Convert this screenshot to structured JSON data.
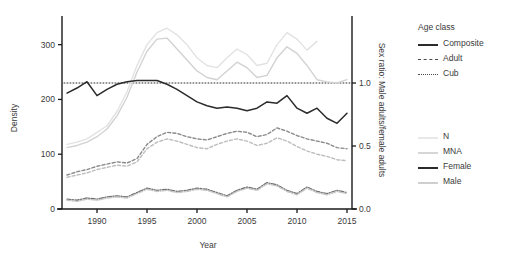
{
  "chart_data": {
    "type": "line",
    "title": "",
    "xlabel": "Year",
    "ylabel": "Density",
    "y2label": "Sex ratio: Male adults/female adults",
    "xlim": [
      1986.5,
      2015.5
    ],
    "ylim": [
      0,
      345
    ],
    "y2lim": [
      0,
      1.5
    ],
    "grid": false,
    "xticks": [
      "1990",
      "1995",
      "2000",
      "2005",
      "2010",
      "2015"
    ],
    "xtick_values": [
      1990,
      1995,
      2000,
      2005,
      2010,
      2015
    ],
    "yticks": [
      "0",
      "100",
      "200",
      "300"
    ],
    "ytick_values": [
      0,
      100,
      200,
      300
    ],
    "y2ticks": [
      "0.0",
      "0.5",
      "1.0"
    ],
    "y2tick_values": [
      0.0,
      0.5,
      1.0
    ],
    "reference_line": {
      "axis": "y2",
      "value": 1.0,
      "style": "dotted",
      "color": "#2b2b2b"
    },
    "x": [
      1987,
      1988,
      1989,
      1990,
      1991,
      1992,
      1993,
      1994,
      1995,
      1996,
      1997,
      1998,
      1999,
      2000,
      2001,
      2002,
      2003,
      2004,
      2005,
      2006,
      2007,
      2008,
      2009,
      2010,
      2011,
      2012,
      2013,
      2014,
      2015
    ],
    "series": [
      {
        "name": "N",
        "age_class": "Composite",
        "linestyle": "solid",
        "color": "#e2e2e2",
        "axis": "left",
        "values": [
          118,
          122,
          128,
          140,
          152,
          178,
          214,
          262,
          300,
          322,
          330,
          318,
          300,
          276,
          262,
          258,
          276,
          292,
          282,
          262,
          266,
          300,
          322,
          310,
          290,
          306,
          null,
          null,
          null
        ]
      },
      {
        "name": "MNA",
        "age_class": "Composite",
        "linestyle": "solid",
        "color": "#d2d2d2",
        "axis": "left",
        "values": [
          112,
          116,
          122,
          132,
          146,
          170,
          204,
          250,
          288,
          310,
          312,
          292,
          272,
          252,
          240,
          236,
          252,
          268,
          258,
          240,
          244,
          276,
          296,
          284,
          262,
          236,
          232,
          230,
          236
        ]
      },
      {
        "name": "N",
        "age_class": "Adult",
        "linestyle": "dashed",
        "color": "#8a8a8a",
        "axis": "left",
        "values": [
          62,
          68,
          72,
          78,
          82,
          86,
          84,
          92,
          118,
          132,
          140,
          138,
          132,
          128,
          126,
          132,
          138,
          142,
          140,
          132,
          136,
          148,
          142,
          134,
          128,
          124,
          120,
          112,
          110
        ]
      },
      {
        "name": "MNA",
        "age_class": "Adult",
        "linestyle": "dashed",
        "color": "#bdbdbd",
        "axis": "left",
        "values": [
          58,
          62,
          66,
          72,
          76,
          80,
          78,
          86,
          110,
          122,
          128,
          124,
          118,
          112,
          110,
          118,
          124,
          128,
          124,
          116,
          120,
          130,
          124,
          114,
          106,
          100,
          96,
          90,
          88
        ]
      },
      {
        "name": "N",
        "age_class": "Cub",
        "linestyle": "dashdot",
        "color": "#6e6e6e",
        "axis": "left",
        "values": [
          18,
          16,
          20,
          18,
          22,
          24,
          22,
          30,
          38,
          34,
          36,
          32,
          34,
          38,
          36,
          30,
          24,
          34,
          40,
          36,
          48,
          44,
          34,
          28,
          40,
          32,
          28,
          34,
          30
        ]
      },
      {
        "name": "MNA",
        "age_class": "Cub",
        "linestyle": "dashdot",
        "color": "#c6c6c6",
        "axis": "left",
        "values": [
          16,
          14,
          18,
          16,
          20,
          22,
          20,
          28,
          36,
          32,
          34,
          30,
          32,
          36,
          34,
          28,
          22,
          32,
          38,
          34,
          46,
          42,
          32,
          26,
          38,
          30,
          26,
          32,
          28
        ]
      },
      {
        "name": "Female",
        "age_class": "Composite",
        "linestyle": "solid",
        "color": "#2b2b2b",
        "axis": "right",
        "values": [
          0.92,
          0.96,
          1.01,
          0.9,
          0.95,
          0.99,
          1.01,
          1.02,
          1.02,
          1.02,
          0.99,
          0.95,
          0.9,
          0.85,
          0.82,
          0.8,
          0.81,
          0.8,
          0.78,
          0.8,
          0.85,
          0.84,
          0.9,
          0.8,
          0.76,
          0.8,
          0.72,
          0.68,
          0.76
        ]
      }
    ],
    "legends": [
      {
        "title": "Age class",
        "entries": [
          {
            "label": "Composite",
            "linestyle": "solid",
            "color": "#2b2b2b"
          },
          {
            "label": "Adult",
            "linestyle": "dashed",
            "color": "#4a4a4a"
          },
          {
            "label": "Cub",
            "linestyle": "dashdot",
            "color": "#4a4a4a"
          }
        ]
      },
      {
        "title": "",
        "entries": [
          {
            "label": "N",
            "linestyle": "solid",
            "color": "#e8e8e8"
          },
          {
            "label": "MNA",
            "linestyle": "solid",
            "color": "#d6d6d6"
          },
          {
            "label": "Female",
            "linestyle": "solid",
            "color": "#2b2b2b"
          },
          {
            "label": "Male",
            "linestyle": "solid",
            "color": "#cfcfcf"
          }
        ]
      }
    ]
  }
}
